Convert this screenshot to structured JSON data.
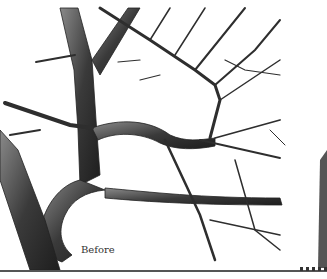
{
  "figure": {
    "caption": "Before",
    "colors": {
      "ink": "#2a2a2a",
      "mid_tone": "#6b6b6b",
      "highlight": "#e8e8e8",
      "paper": "#ffffff",
      "rule": "#555555"
    }
  }
}
